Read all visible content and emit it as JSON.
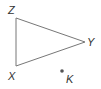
{
  "diagram": {
    "type": "geometry",
    "triangle": {
      "vertices": [
        {
          "name": "Z",
          "x": 16,
          "y": 18
        },
        {
          "name": "Y",
          "x": 85,
          "y": 42
        },
        {
          "name": "X",
          "x": 16,
          "y": 66
        }
      ],
      "stroke": "#777777"
    },
    "point": {
      "name": "K",
      "x": 62,
      "y": 71,
      "color": "#555555"
    },
    "labels": {
      "Z": "Z",
      "Y": "Y",
      "X": "X",
      "K": "K"
    }
  }
}
